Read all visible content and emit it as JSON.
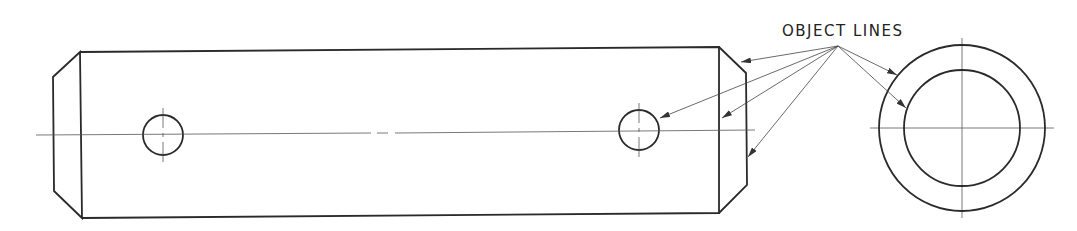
{
  "diagram": {
    "label": "OBJECT LINES",
    "views": [
      "side-view",
      "end-view"
    ],
    "colors": {
      "line": "#2a2a2a",
      "thin": "#555555",
      "background": "#ffffff"
    }
  }
}
